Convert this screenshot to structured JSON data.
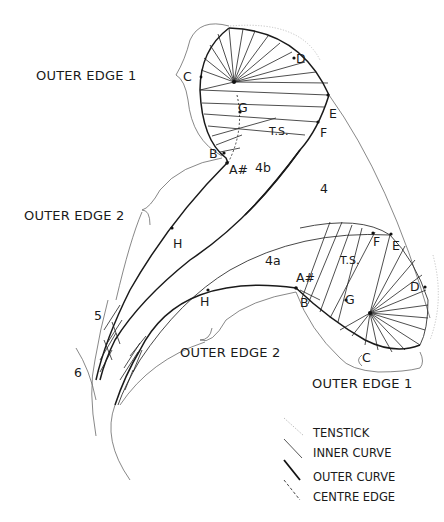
{
  "diagram": {
    "type": "construction-diagram",
    "upper_petal": {
      "outer_edge_label": "OUTER EDGE 1",
      "points": {
        "C": "C",
        "D": "D",
        "E": "E",
        "F": "F",
        "G": "G",
        "TS": "T.S.",
        "B": "B",
        "A": "A#"
      },
      "region_label": "4b"
    },
    "middle_region_label": "4",
    "lower_petal": {
      "outer_edge_label": "OUTER EDGE 1",
      "points": {
        "C": "C",
        "D": "D",
        "E": "E",
        "F": "F",
        "G": "G",
        "TS": "T.S.",
        "B": "B",
        "A": "A#"
      },
      "region_label": "4a"
    },
    "outer_edge_2_upper": "OUTER EDGE 2",
    "outer_edge_2_lower": "OUTER EDGE 2",
    "h_upper": "H",
    "h_lower": "H",
    "num_5": "5",
    "num_6": "6"
  },
  "legend": {
    "items": [
      {
        "label": "TENSTICK",
        "style": "dotted-light"
      },
      {
        "label": "INNER CURVE",
        "style": "thin"
      },
      {
        "label": "OUTER CURVE",
        "style": "thick"
      },
      {
        "label": "CENTRE EDGE",
        "style": "dashed-dotted"
      }
    ]
  },
  "colors": {
    "ink": "#1a1a1a",
    "tenstick": "#bdbdbd",
    "background": "#ffffff"
  }
}
